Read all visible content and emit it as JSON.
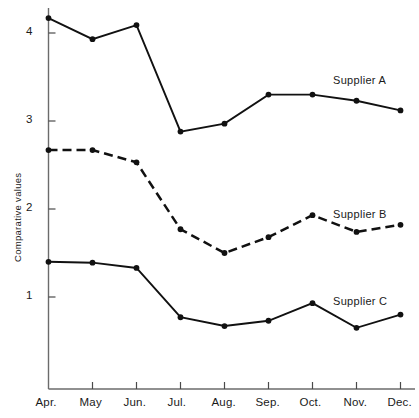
{
  "chart_data": {
    "type": "line",
    "title": "",
    "xlabel": "",
    "ylabel": "Comparative values",
    "categories": [
      "Apr.",
      "May",
      "Jun.",
      "Jul.",
      "Aug.",
      "Sep.",
      "Oct.",
      "Nov.",
      "Dec."
    ],
    "ylim": [
      0,
      4.45
    ],
    "yticks": [
      1,
      2,
      3,
      4
    ],
    "ytick_labels": [
      "1",
      "2",
      "3",
      "4"
    ],
    "grid": false,
    "legend": "inline-right-labels",
    "series": [
      {
        "name": "Supplier A",
        "style": "solid",
        "marker": "filled-circle",
        "values": [
          4.17,
          3.93,
          4.09,
          2.88,
          2.97,
          3.3,
          3.3,
          3.23,
          3.12
        ]
      },
      {
        "name": "Supplier B",
        "style": "dashed",
        "marker": "filled-circle",
        "values": [
          2.67,
          2.67,
          2.53,
          1.77,
          1.5,
          1.68,
          1.93,
          1.74,
          1.82
        ]
      },
      {
        "name": "Supplier C",
        "style": "solid",
        "marker": "filled-circle",
        "values": [
          1.4,
          1.39,
          1.33,
          0.77,
          0.67,
          0.73,
          0.93,
          0.65,
          0.8
        ]
      }
    ],
    "annotations": [
      {
        "text": "Supplier A",
        "series": "Supplier A"
      },
      {
        "text": "Supplier B",
        "series": "Supplier B"
      },
      {
        "text": "Supplier C",
        "series": "Supplier C"
      }
    ],
    "colors": {
      "line": "#111111",
      "axis": "#6b6b6b",
      "background": "#ffffff"
    }
  },
  "axis": {
    "y_title": "Comparative values",
    "y_ticks": [
      "1",
      "2",
      "3",
      "4"
    ],
    "x_ticks": [
      "Apr.",
      "May",
      "Jun.",
      "Jul.",
      "Aug.",
      "Sep.",
      "Oct.",
      "Nov.",
      "Dec."
    ]
  },
  "labels": {
    "supplier_a": "Supplier A",
    "supplier_b": "Supplier B",
    "supplier_c": "Supplier C"
  }
}
